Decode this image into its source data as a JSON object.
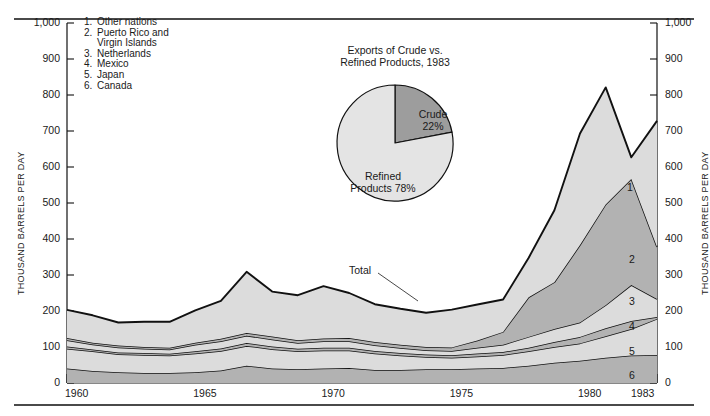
{
  "axes": {
    "y_title_left": "THOUSAND BARRELS PER DAY",
    "y_title_right": "THOUSAND BARRELS PER DAY",
    "y_ticks": [
      "0",
      "100",
      "200",
      "300",
      "400",
      "500",
      "600",
      "700",
      "800",
      "900",
      "1,000"
    ],
    "x_ticks": [
      "1960",
      "1965",
      "1970",
      "1975",
      "1980",
      "1983"
    ]
  },
  "legend": {
    "items": [
      {
        "num": "1.",
        "label": "Other nations",
        "cont": ""
      },
      {
        "num": "2.",
        "label": "Puerto Rico and",
        "cont": "Virgin Islands"
      },
      {
        "num": "3.",
        "label": "Netherlands",
        "cont": ""
      },
      {
        "num": "4.",
        "label": "Mexico",
        "cont": ""
      },
      {
        "num": "5.",
        "label": "Japan",
        "cont": ""
      },
      {
        "num": "6.",
        "label": "Canada",
        "cont": ""
      }
    ]
  },
  "annotations": {
    "total": "Total",
    "band_labels": [
      "1",
      "2",
      "3",
      "4",
      "5",
      "6"
    ]
  },
  "pie": {
    "title_line1": "Exports of Crude vs.",
    "title_line2": "Refined Products, 1983",
    "crude_label": "Crude",
    "crude_value": "22%",
    "refined_label": "Refined",
    "refined_value": "Products 78%"
  },
  "colors": {
    "band_light": "#dcdcdc",
    "band_dark": "#b2b2b2",
    "pie_crude": "#9d9d9d",
    "pie_refined": "#e4e4e4",
    "stroke": "#111111",
    "rule": "#4a4a4a"
  },
  "chart_data": {
    "type": "area",
    "xlabel": "",
    "ylabel": "THOUSAND BARRELS PER DAY",
    "ylim": [
      0,
      1000
    ],
    "xlim": [
      1960,
      1983
    ],
    "grid": false,
    "legend_position": "upper-left",
    "stacked": true,
    "stack_order_bottom_to_top": [
      "6",
      "5",
      "4",
      "3",
      "2",
      "1"
    ],
    "x": [
      1960,
      1961,
      1962,
      1963,
      1964,
      1965,
      1966,
      1967,
      1968,
      1969,
      1970,
      1971,
      1972,
      1973,
      1974,
      1975,
      1976,
      1977,
      1978,
      1979,
      1980,
      1981,
      1982,
      1983
    ],
    "series": [
      {
        "name": "6. Canada",
        "values": [
          40,
          33,
          30,
          28,
          28,
          30,
          35,
          48,
          40,
          38,
          40,
          42,
          36,
          36,
          38,
          38,
          40,
          42,
          48,
          56,
          62,
          70,
          76,
          78
        ]
      },
      {
        "name": "5. Japan",
        "values": [
          55,
          55,
          50,
          50,
          48,
          52,
          54,
          55,
          54,
          50,
          50,
          48,
          46,
          40,
          34,
          32,
          34,
          36,
          40,
          44,
          48,
          60,
          74,
          100
        ]
      },
      {
        "name": "4. Mexico",
        "values": [
          6,
          5,
          5,
          5,
          5,
          6,
          7,
          8,
          7,
          7,
          8,
          8,
          7,
          7,
          7,
          7,
          8,
          8,
          10,
          14,
          18,
          22,
          22,
          5
        ]
      },
      {
        "name": "3. Netherlands",
        "values": [
          18,
          14,
          14,
          12,
          12,
          18,
          20,
          20,
          20,
          16,
          18,
          18,
          16,
          14,
          12,
          12,
          16,
          20,
          30,
          36,
          40,
          64,
          100,
          50
        ]
      },
      {
        "name": "2. Puerto Rico and Virgin Islands",
        "values": [
          6,
          5,
          5,
          5,
          5,
          6,
          7,
          8,
          8,
          8,
          8,
          9,
          9,
          9,
          9,
          10,
          20,
          36,
          110,
          130,
          215,
          280,
          295,
          145
        ]
      },
      {
        "name": "1. Other nations",
        "values": [
          78,
          76,
          64,
          70,
          72,
          90,
          105,
          170,
          125,
          125,
          145,
          125,
          105,
          100,
          95,
          105,
          100,
          90,
          110,
          200,
          310,
          325,
          60,
          350
        ]
      }
    ],
    "totals": [
      203,
      188,
      168,
      170,
      170,
      202,
      228,
      309,
      254,
      244,
      269,
      250,
      219,
      206,
      195,
      204,
      218,
      232,
      348,
      480,
      693,
      821,
      627,
      748
    ]
  }
}
